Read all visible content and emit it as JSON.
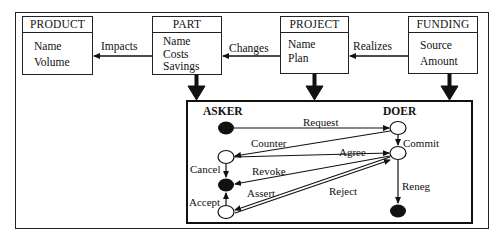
{
  "entities": {
    "product": {
      "title": "PRODUCT",
      "attributes": [
        "Name",
        "Volume"
      ]
    },
    "part": {
      "title": "PART",
      "attributes": [
        "Name",
        "Costs",
        "Savings"
      ]
    },
    "project": {
      "title": "PROJECT",
      "attributes": [
        "Name",
        "Plan"
      ]
    },
    "funding": {
      "title": "FUNDING",
      "attributes": [
        "Source",
        "Amount"
      ]
    }
  },
  "relationships": {
    "impacts": "Impacts",
    "changes": "Changes",
    "realizes": "Realizes"
  },
  "conversation": {
    "roles": {
      "asker": "ASKER",
      "doer": "DOER"
    },
    "transitions": {
      "request": "Request",
      "counter": "Counter",
      "commit": "Commit",
      "agree": "Agree",
      "cancel": "Cancel",
      "revoke": "Revoke",
      "assert": "Assert",
      "reject": "Reject",
      "accept": "Accept",
      "reneg": "Reneg"
    },
    "states": [
      {
        "id": "asker-start",
        "role": "asker",
        "filled": true
      },
      {
        "id": "asker-counter",
        "role": "asker",
        "filled": false
      },
      {
        "id": "asker-end",
        "role": "asker",
        "filled": true
      },
      {
        "id": "asker-accept",
        "role": "asker",
        "filled": false
      },
      {
        "id": "doer-request",
        "role": "doer",
        "filled": false
      },
      {
        "id": "doer-commit",
        "role": "doer",
        "filled": false
      },
      {
        "id": "doer-end",
        "role": "doer",
        "filled": true
      }
    ]
  }
}
